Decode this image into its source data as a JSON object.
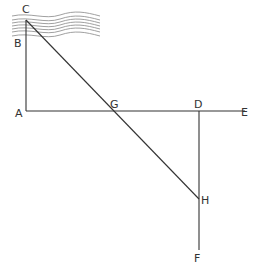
{
  "diagram": {
    "type": "geometry-construction",
    "colors": {
      "line": "#333333",
      "water": "#777777",
      "background": "#ffffff"
    },
    "points": [
      {
        "id": "C",
        "label": "C",
        "x": 26,
        "y": 20,
        "lx": 22,
        "ly": 13
      },
      {
        "id": "B",
        "label": "B",
        "x": 26,
        "y": 40,
        "lx": 14,
        "ly": 47
      },
      {
        "id": "A",
        "label": "A",
        "x": 26,
        "y": 111,
        "lx": 15,
        "ly": 117
      },
      {
        "id": "G",
        "label": "G",
        "x": 112,
        "y": 111,
        "lx": 110,
        "ly": 108
      },
      {
        "id": "D",
        "label": "D",
        "x": 199,
        "y": 111,
        "lx": 194,
        "ly": 108
      },
      {
        "id": "E",
        "label": "E",
        "x": 245,
        "y": 111,
        "lx": 241,
        "ly": 116
      },
      {
        "id": "H",
        "label": "H",
        "x": 199,
        "y": 199,
        "lx": 201,
        "ly": 204
      },
      {
        "id": "F",
        "label": "F",
        "x": 199,
        "y": 250,
        "lx": 194,
        "ly": 262
      }
    ],
    "segments": [
      [
        "C",
        "A"
      ],
      [
        "A",
        "E"
      ],
      [
        "C",
        "H"
      ],
      [
        "D",
        "F"
      ]
    ],
    "annotation": "River (wavy band) at top with C on far bank, B on near bank"
  }
}
